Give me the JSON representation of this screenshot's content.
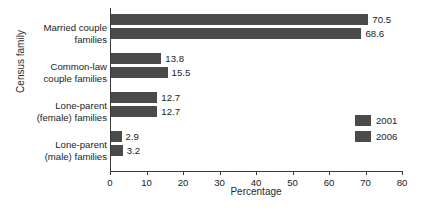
{
  "chart_data": {
    "type": "bar",
    "orientation": "horizontal",
    "title": "",
    "xlabel": "Percentage",
    "ylabel": "Census family",
    "categories": [
      "Married couple families",
      "Common-law couple families",
      "Lone-parent (female) families",
      "Lone-parent (male) families"
    ],
    "category_lines": [
      [
        "Married couple",
        "families"
      ],
      [
        "Common-law",
        "couple families"
      ],
      [
        "Lone-parent",
        "(female) families"
      ],
      [
        "Lone-parent",
        "(male) families"
      ]
    ],
    "series": [
      {
        "name": "2001",
        "values": [
          70.5,
          13.8,
          12.7,
          2.9
        ],
        "color": "#4a4a4a"
      },
      {
        "name": "2006",
        "values": [
          68.6,
          15.5,
          12.7,
          3.2
        ],
        "color": "#4a4a4a"
      }
    ],
    "value_labels": [
      [
        "70.5",
        "68.6"
      ],
      [
        "13.8",
        "15.5"
      ],
      [
        "12.7",
        "12.7"
      ],
      [
        "2.9",
        "3.2"
      ]
    ],
    "xlim": [
      0,
      80
    ],
    "xticks": [
      0,
      10,
      20,
      30,
      40,
      50,
      60,
      70,
      80
    ],
    "xtick_labels": [
      "0",
      "10",
      "20",
      "30",
      "40",
      "50",
      "60",
      "70",
      "80"
    ],
    "grid": false,
    "legend_position": "right-inside",
    "legend_entries": [
      "2001",
      "2006"
    ]
  }
}
